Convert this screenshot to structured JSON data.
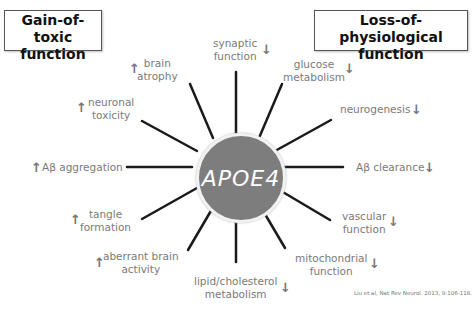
{
  "headers": {
    "left": "Gain-of-toxic function",
    "left_line1": "Gain-of-toxic",
    "left_line2": "function",
    "right": "Loss-of-physiological function",
    "right_line1": "Loss-of-physiological",
    "right_line2": "function"
  },
  "center": {
    "label": "APOE4",
    "color": "#7d7d7d"
  },
  "gain_effects": [
    {
      "label": "brain atrophy",
      "line1": "brain",
      "line2": "atrophy",
      "direction": "up"
    },
    {
      "label": "neuronal toxicity",
      "line1": "neuronal",
      "line2": "toxicity",
      "direction": "up"
    },
    {
      "label": "Aβ aggregation",
      "line1": "Aβ aggregation",
      "direction": "up"
    },
    {
      "label": "tangle formation",
      "line1": "tangle",
      "line2": "formation",
      "direction": "up"
    },
    {
      "label": "aberrant brain activity",
      "line1": "aberrant brain",
      "line2": "activity",
      "direction": "up"
    }
  ],
  "loss_effects": [
    {
      "label": "synaptic function",
      "line1": "synaptic",
      "line2": "function",
      "direction": "down"
    },
    {
      "label": "glucose metabolism",
      "line1": "glucose",
      "line2": "metabolism",
      "direction": "down"
    },
    {
      "label": "neurogenesis",
      "line1": "neurogenesis",
      "direction": "down"
    },
    {
      "label": "Aβ clearance",
      "line1": "Aβ clearance",
      "direction": "down"
    },
    {
      "label": "vascular function",
      "line1": "vascular",
      "line2": "function",
      "direction": "down"
    },
    {
      "label": "mitochondrial function",
      "line1": "mitochondrial",
      "line2": "function",
      "direction": "down"
    },
    {
      "label": "lipid/cholesterol metabolism",
      "line1": "lipid/cholesterol",
      "line2": "metabolism",
      "direction": "down"
    }
  ],
  "arrows": {
    "up": "↑",
    "down": "↓"
  },
  "citation": "Liu et al, Nat Rev Neurol. 2013, 9:106-118."
}
